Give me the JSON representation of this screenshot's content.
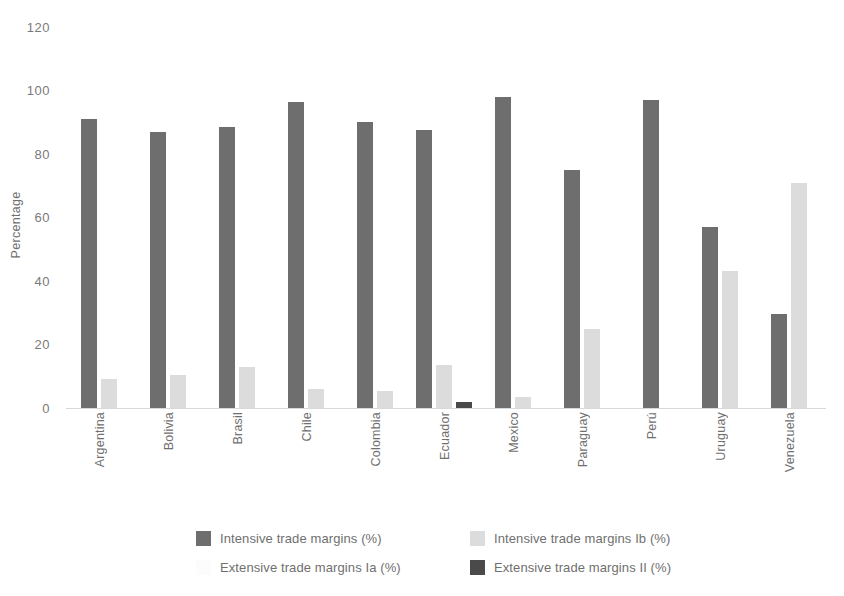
{
  "chart_data": {
    "type": "bar",
    "title": "",
    "xlabel": "",
    "ylabel": "Percentage",
    "ylim": [
      0,
      120
    ],
    "yticks": [
      0,
      20,
      40,
      60,
      80,
      100,
      120
    ],
    "ytick_labels": [
      "0",
      "20",
      "40",
      "60",
      "80",
      "100",
      "120"
    ],
    "grid": false,
    "legend_position": "bottom",
    "categories": [
      "Argentina",
      "Bolivia",
      "Brasil",
      "Chile",
      "Colombia",
      "Ecuador",
      "Mexico",
      "Paraguay",
      "Perú",
      "Uruguay",
      "Venezuela"
    ],
    "series": [
      {
        "name": "Intensive trade margins (%)",
        "color": "#6e6e6e",
        "values": [
          91,
          87,
          88.5,
          96.5,
          90,
          87.5,
          98,
          75,
          97,
          57,
          29.5
        ]
      },
      {
        "name": "Extensive trade margins Ia (%)",
        "color": "#fcfcfc",
        "values": [
          0,
          0,
          0,
          0,
          0,
          0,
          0,
          0,
          0,
          0,
          0
        ]
      },
      {
        "name": "Intensive trade margins Ib (%)",
        "color": "#dcdcdc",
        "values": [
          9,
          10.5,
          13,
          6,
          5.5,
          13.5,
          3.5,
          25,
          0,
          43,
          71
        ]
      },
      {
        "name": "Extensive trade margins II (%)",
        "color": "#4a4a4a",
        "values": [
          0,
          0,
          0,
          0,
          0,
          2,
          0,
          0,
          0,
          0,
          0
        ]
      }
    ]
  },
  "axis": {
    "y_title": "Percentage"
  },
  "legend": {
    "items": [
      {
        "label": "Intensive trade margins (%)",
        "series": 0
      },
      {
        "label": "Intensive trade margins Ib (%)",
        "series": 2
      },
      {
        "label": "Extensive trade margins Ia (%)",
        "series": 1
      },
      {
        "label": "Extensive trade margins II (%)",
        "series": 3
      }
    ]
  }
}
